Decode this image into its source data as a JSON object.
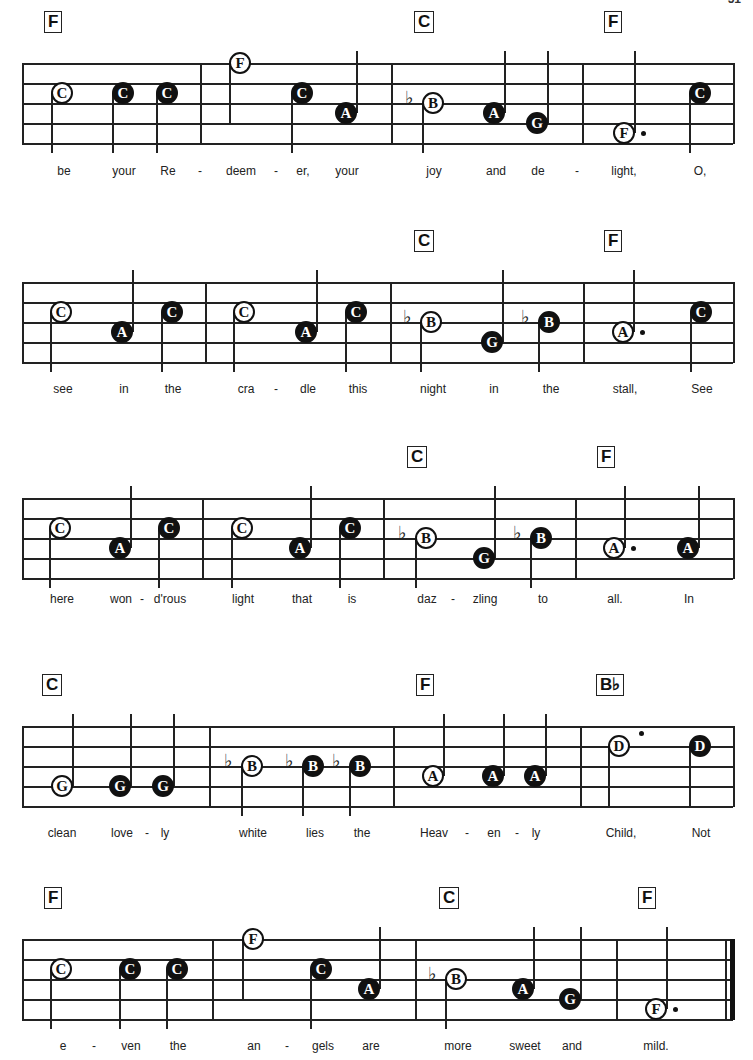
{
  "page_number": "51",
  "systems": [
    {
      "staff_top": 63,
      "left": 22,
      "right": 733,
      "barlines": [
        200,
        391,
        582
      ],
      "final": false,
      "chords": [
        {
          "label": "F",
          "x": 54
        },
        {
          "label": "C",
          "x": 424
        },
        {
          "label": "F",
          "x": 614
        }
      ],
      "notes": [
        {
          "name": "C",
          "pos": "C",
          "x": 62,
          "type": "open",
          "stem": "down"
        },
        {
          "name": "C",
          "pos": "C",
          "x": 123,
          "type": "filled",
          "stem": "down"
        },
        {
          "name": "C",
          "pos": "C",
          "x": 167,
          "type": "filled",
          "stem": "down"
        },
        {
          "name": "F",
          "pos": "F_high",
          "x": 240,
          "type": "open",
          "stem": "down_long"
        },
        {
          "name": "C",
          "pos": "C",
          "x": 302,
          "type": "filled",
          "stem": "down"
        },
        {
          "name": "A",
          "pos": "A",
          "x": 346,
          "type": "filled",
          "stem": "up"
        },
        {
          "name": "B",
          "pos": "B",
          "x": 433,
          "type": "open",
          "stem": "down",
          "flat": true
        },
        {
          "name": "A",
          "pos": "A",
          "x": 494,
          "type": "filled",
          "stem": "up"
        },
        {
          "name": "G",
          "pos": "G",
          "x": 537,
          "type": "filled",
          "stem": "up"
        },
        {
          "name": "F",
          "pos": "F_low",
          "x": 624,
          "type": "open",
          "stem": "up",
          "dot": true
        },
        {
          "name": "C",
          "pos": "C",
          "x": 700,
          "type": "filled",
          "stem": "down"
        }
      ],
      "lyrics": [
        {
          "text": "be",
          "x": 64
        },
        {
          "text": "your",
          "x": 124
        },
        {
          "text": "Re",
          "x": 168
        },
        {
          "text": "-",
          "x": 200
        },
        {
          "text": "deem",
          "x": 241
        },
        {
          "text": "-",
          "x": 276
        },
        {
          "text": "er,",
          "x": 303
        },
        {
          "text": "your",
          "x": 347
        },
        {
          "text": "joy",
          "x": 434
        },
        {
          "text": "and",
          "x": 496
        },
        {
          "text": "de",
          "x": 538
        },
        {
          "text": "-",
          "x": 577
        },
        {
          "text": "light,",
          "x": 624
        },
        {
          "text": "O,",
          "x": 700
        }
      ],
      "lyrics_y": 178
    },
    {
      "staff_top": 282,
      "left": 22,
      "right": 733,
      "barlines": [
        205,
        390,
        583
      ],
      "final": false,
      "chords": [
        {
          "label": "C",
          "x": 424
        },
        {
          "label": "F",
          "x": 614
        }
      ],
      "notes": [
        {
          "name": "C",
          "pos": "C",
          "x": 61,
          "type": "open",
          "stem": "down"
        },
        {
          "name": "A",
          "pos": "A",
          "x": 122,
          "type": "filled",
          "stem": "up"
        },
        {
          "name": "C",
          "pos": "C",
          "x": 172,
          "type": "filled",
          "stem": "down"
        },
        {
          "name": "C",
          "pos": "C",
          "x": 244,
          "type": "open",
          "stem": "down"
        },
        {
          "name": "A",
          "pos": "A",
          "x": 306,
          "type": "filled",
          "stem": "up"
        },
        {
          "name": "C",
          "pos": "C",
          "x": 356,
          "type": "filled",
          "stem": "down"
        },
        {
          "name": "B",
          "pos": "B",
          "x": 431,
          "type": "open",
          "stem": "down",
          "flat": true
        },
        {
          "name": "G",
          "pos": "G",
          "x": 492,
          "type": "filled",
          "stem": "up"
        },
        {
          "name": "B",
          "pos": "B",
          "x": 549,
          "type": "filled",
          "stem": "down",
          "flat": true
        },
        {
          "name": "A",
          "pos": "A",
          "x": 623,
          "type": "open",
          "stem": "up",
          "dot": true
        },
        {
          "name": "C",
          "pos": "C",
          "x": 701,
          "type": "filled",
          "stem": "down"
        }
      ],
      "lyrics": [
        {
          "text": "see",
          "x": 63
        },
        {
          "text": "in",
          "x": 124
        },
        {
          "text": "the",
          "x": 173
        },
        {
          "text": "cra",
          "x": 246
        },
        {
          "text": "-",
          "x": 276
        },
        {
          "text": "dle",
          "x": 308
        },
        {
          "text": "this",
          "x": 358
        },
        {
          "text": "night",
          "x": 433
        },
        {
          "text": "in",
          "x": 494
        },
        {
          "text": "the",
          "x": 551
        },
        {
          "text": "stall,",
          "x": 625
        },
        {
          "text": "See",
          "x": 702
        }
      ],
      "lyrics_y": 396
    },
    {
      "staff_top": 498,
      "left": 22,
      "right": 733,
      "barlines": [
        202,
        383,
        575
      ],
      "final": false,
      "chords": [
        {
          "label": "C",
          "x": 417
        },
        {
          "label": "F",
          "x": 607
        }
      ],
      "notes": [
        {
          "name": "C",
          "pos": "C",
          "x": 60,
          "type": "open",
          "stem": "down"
        },
        {
          "name": "A",
          "pos": "A",
          "x": 120,
          "type": "filled",
          "stem": "up"
        },
        {
          "name": "C",
          "pos": "C",
          "x": 169,
          "type": "filled",
          "stem": "down"
        },
        {
          "name": "C",
          "pos": "C",
          "x": 242,
          "type": "open",
          "stem": "down"
        },
        {
          "name": "A",
          "pos": "A",
          "x": 300,
          "type": "filled",
          "stem": "up"
        },
        {
          "name": "C",
          "pos": "C",
          "x": 350,
          "type": "filled",
          "stem": "down"
        },
        {
          "name": "B",
          "pos": "B",
          "x": 426,
          "type": "open",
          "stem": "down",
          "flat": true
        },
        {
          "name": "G",
          "pos": "G",
          "x": 484,
          "type": "filled",
          "stem": "up"
        },
        {
          "name": "B",
          "pos": "B",
          "x": 541,
          "type": "filled",
          "stem": "down",
          "flat": true
        },
        {
          "name": "A",
          "pos": "A",
          "x": 614,
          "type": "open",
          "stem": "up",
          "dot": true
        },
        {
          "name": "A",
          "pos": "A",
          "x": 688,
          "type": "filled",
          "stem": "up"
        }
      ],
      "lyrics": [
        {
          "text": "here",
          "x": 62
        },
        {
          "text": "won",
          "x": 121
        },
        {
          "text": "-",
          "x": 142
        },
        {
          "text": "d'rous",
          "x": 170
        },
        {
          "text": "light",
          "x": 243
        },
        {
          "text": "that",
          "x": 302
        },
        {
          "text": "is",
          "x": 352
        },
        {
          "text": "daz",
          "x": 427
        },
        {
          "text": "-",
          "x": 453
        },
        {
          "text": "zling",
          "x": 485
        },
        {
          "text": "to",
          "x": 543
        },
        {
          "text": "all.",
          "x": 615
        },
        {
          "text": "In",
          "x": 689
        }
      ],
      "lyrics_y": 606
    },
    {
      "staff_top": 726,
      "left": 22,
      "right": 733,
      "barlines": [
        209,
        393,
        580
      ],
      "final": false,
      "chords": [
        {
          "label": "C",
          "x": 52
        },
        {
          "label": "F",
          "x": 426
        },
        {
          "label": "B♭",
          "x": 606
        }
      ],
      "notes": [
        {
          "name": "G",
          "pos": "G",
          "x": 62,
          "type": "open",
          "stem": "up"
        },
        {
          "name": "G",
          "pos": "G",
          "x": 120,
          "type": "filled",
          "stem": "up"
        },
        {
          "name": "G",
          "pos": "G",
          "x": 163,
          "type": "filled",
          "stem": "up"
        },
        {
          "name": "B",
          "pos": "B",
          "x": 252,
          "type": "open",
          "stem": "down",
          "flat": true
        },
        {
          "name": "B",
          "pos": "B",
          "x": 313,
          "type": "filled",
          "stem": "down",
          "flat": true
        },
        {
          "name": "B",
          "pos": "B",
          "x": 360,
          "type": "filled",
          "stem": "down",
          "flat": true
        },
        {
          "name": "A",
          "pos": "A",
          "x": 433,
          "type": "open",
          "stem": "up"
        },
        {
          "name": "A",
          "pos": "A",
          "x": 493,
          "type": "filled",
          "stem": "up"
        },
        {
          "name": "A",
          "pos": "A",
          "x": 535,
          "type": "filled",
          "stem": "up"
        },
        {
          "name": "D",
          "pos": "D",
          "x": 619,
          "type": "open",
          "stem": "down_to_bottom",
          "dot_high": true
        },
        {
          "name": "D",
          "pos": "D",
          "x": 700,
          "type": "filled",
          "stem": "down_to_bottom"
        }
      ],
      "lyrics": [
        {
          "text": "clean",
          "x": 62
        },
        {
          "text": "love",
          "x": 122
        },
        {
          "text": "-",
          "x": 147
        },
        {
          "text": "ly",
          "x": 165
        },
        {
          "text": "white",
          "x": 253
        },
        {
          "text": "lies",
          "x": 315
        },
        {
          "text": "the",
          "x": 362
        },
        {
          "text": "Heav",
          "x": 434
        },
        {
          "text": "-",
          "x": 467
        },
        {
          "text": "en",
          "x": 494
        },
        {
          "text": "-",
          "x": 517
        },
        {
          "text": "ly",
          "x": 536
        },
        {
          "text": "Child,",
          "x": 621
        },
        {
          "text": "Not",
          "x": 701
        }
      ],
      "lyrics_y": 840
    },
    {
      "staff_top": 939,
      "left": 22,
      "right": 733,
      "barlines": [
        212,
        415,
        616
      ],
      "final": true,
      "chords": [
        {
          "label": "F",
          "x": 54
        },
        {
          "label": "C",
          "x": 449
        },
        {
          "label": "F",
          "x": 648
        }
      ],
      "notes": [
        {
          "name": "C",
          "pos": "C",
          "x": 61,
          "type": "open",
          "stem": "down"
        },
        {
          "name": "C",
          "pos": "C",
          "x": 130,
          "type": "filled",
          "stem": "down"
        },
        {
          "name": "C",
          "pos": "C",
          "x": 177,
          "type": "filled",
          "stem": "down"
        },
        {
          "name": "F",
          "pos": "F_high",
          "x": 253,
          "type": "open",
          "stem": "down_long"
        },
        {
          "name": "C",
          "pos": "C",
          "x": 321,
          "type": "filled",
          "stem": "down"
        },
        {
          "name": "A",
          "pos": "A",
          "x": 369,
          "type": "filled",
          "stem": "up"
        },
        {
          "name": "B",
          "pos": "B",
          "x": 456,
          "type": "open",
          "stem": "down",
          "flat": true
        },
        {
          "name": "A",
          "pos": "A",
          "x": 523,
          "type": "filled",
          "stem": "up"
        },
        {
          "name": "G",
          "pos": "G",
          "x": 570,
          "type": "filled",
          "stem": "up"
        },
        {
          "name": "F",
          "pos": "F_low",
          "x": 656,
          "type": "open",
          "stem": "up",
          "dot": true
        }
      ],
      "lyrics": [
        {
          "text": "e",
          "x": 63
        },
        {
          "text": "-",
          "x": 94
        },
        {
          "text": "ven",
          "x": 131
        },
        {
          "text": "the",
          "x": 178
        },
        {
          "text": "an",
          "x": 254
        },
        {
          "text": "-",
          "x": 287
        },
        {
          "text": "gels",
          "x": 323
        },
        {
          "text": "are",
          "x": 371
        },
        {
          "text": "more",
          "x": 458
        },
        {
          "text": "sweet",
          "x": 525
        },
        {
          "text": "and",
          "x": 572
        },
        {
          "text": "mild.",
          "x": 656
        }
      ],
      "lyrics_y": 1053
    }
  ]
}
